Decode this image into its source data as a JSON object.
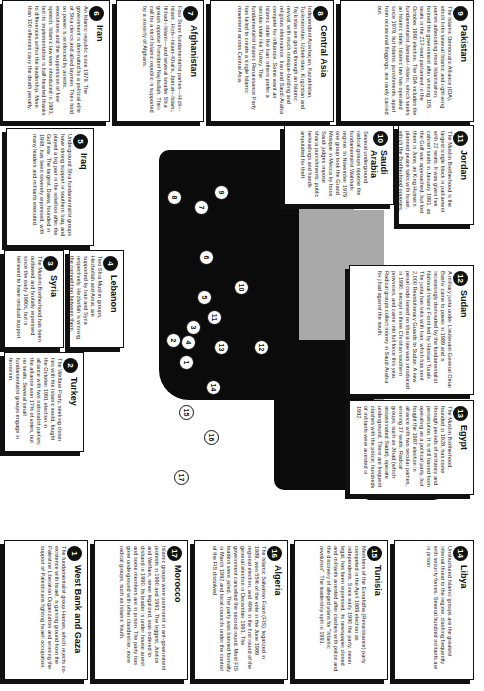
{
  "panels": [
    {
      "n": "1",
      "title": "West Bank and Gaza",
      "body": "The fundamentalist group Hamas, which rejects co-existence with Israel, is gaining ground from the Palestine Liberation Organization and winning the support of Palestinians fighting Israeli occupation."
    },
    {
      "n": "2",
      "title": "Turkey",
      "body": "The Welfare Party, seeking closer ties with the Islamic world, fought the October 1991 election in alliance with two nationalist parties; the alliance won 17% of votes, but no seats. Several small fundamentalist groups engage in terrorism."
    },
    {
      "n": "3",
      "title": "Syria",
      "body": "The Muslim Brotherhood has been outlawed and brutally repressed since the early 1980s, but is believed to have residual support."
    },
    {
      "n": "4",
      "title": "Lebanon",
      "body": "Two Shia Muslim groups, Hezbollah and Amal, are supported by Iran and Syria respectively. Hezbollah is winning the competition between them."
    },
    {
      "n": "5",
      "title": "Iraq",
      "body": "Underground Shia fundamentalist groups have strong support in southern Iraq, and played a big part in the rebellion after the Gulf war. The largest, Dawa, founded in 1968, has been severely repressed, with many leaders and militants executed."
    },
    {
      "n": "6",
      "title": "Iran",
      "body": "An Islamic republic since 1979. The government is dominated by a political elite of Shia clerics and allied laymen. Their hold on power is reinforced by arrests, executions and the suppression of free speech. Islamic law was introduced in 1983, but its implementation is half-hearted thanks to differences within the leadership. More than 100 offences carry the death penalty."
    },
    {
      "n": "7",
      "title": "Afghanistan",
      "body": "Four Sunni fundamentalist parties—Hizb-i-Islami, Hizb-i-Islami-Khalis, Jamiat-i-Islami, Ittihad-i-Islami—and several smaller Shia groups oppose President Najibullah. Their call for a strict Islamic republic is supported by a minority of Afghans."
    },
    {
      "n": "8",
      "title": "Central Asia",
      "body": "Independent Azerbaijan, Kazakhstan, Turkmenistan, Uzbekistan, Kirgizstan and Tajikistan are going through an Islamic revival, with much mosque-building and religious observance. Iran and Saudi Arabia compete for influence. Some want an Islamic state like Iran; others prefer a secular state like Turkey. The fundamentalist Islamic Renaissance Party has failed to create a single Islamic movement across Central Asia."
    },
    {
      "n": "9",
      "title": "Pakistan",
      "body": "The Islamic Democratic Alliance (IDA), which links several Islamic and right-wing parties advocating more Islamisation, formed the government after winning 105 seats in the 217-seat parliament in the October 1990 election. The IDA includes the fundamentalist Jamaat-i-Islami, which seeks an Islamic state. Islamic law has operated since 1979, but Islamic punishments, apart from occasional floggings, are rarely carried out."
    },
    {
      "n": "10",
      "title": "Saudi Arabia",
      "body": "Several underground radical groups oppose the fundamentalist Wahhabi regime. In November 1979 one group took the Grand Mosque in Mecca by force. Saudi judges impose sharia punishments: public beheadings and hands amputated for theft."
    },
    {
      "n": "11",
      "title": "Jordan",
      "body": "The Muslim Brotherhood is the largest single block in parliament with 22 seats. It was given five cabinet seats in January 1991, as the Gulf war approached, but lost them in June, as King Hussein planned peace talks with Israel, which the Brotherhood opposes."
    },
    {
      "n": "12",
      "title": "Sudan",
      "body": "A military junta under Lieutenant-General Omar Bashir came to power in 1989 and is increasingly dominated by the fundamentalist National Islamic Front led by Hassan Turabi. The junta has links with Iran, which has sent 2,000 Revolutionary Guards to Sudan. A new penal code based on sharia law was introduced in 1990, except in three Christian southern provinces, and came into full force this year. Radical groups collect money in Saudi Arabia for jihad against the south."
    },
    {
      "n": "13",
      "title": "Egypt",
      "body": "The Muslim Brotherhood, founded in 1928, has come through periods of militancy and persecution. It is still barred from operating as a political party, but fought the 1987 election in alliance with two secular parties, winning 37 seats. Radical groups, such as Jihad (which assassinated Sadat), operate underground. There are frequent clashes with the police; hundreds of militants were arrested in 1992."
    },
    {
      "n": "14",
      "title": "Libya",
      "body": "Unstructured Islamic groups are the greatest internal threat to the regime, clashing frequently with security forces. Several hundred militants are in prison."
    },
    {
      "n": "15",
      "title": "Tunisia",
      "body": "Members of the Ennahdha (Renaissance) party competed in the April 1989 election as independents. Since early 1990 the party, never legal, has been repressed, its newspaper closed and militants arrested after clashes with police and the discovery of alleged plans for \"Islamic revolution\". The leadership split in 1991."
    },
    {
      "n": "16",
      "title": "Algeria",
      "body": "The Islamic Salvation Front (FIS), legalized in 1989, won 55% of the vote in the June 1989 regional election, and 49% in the first round of the general election in December 1991. The government cancelled the second round. Most FIS leaders were jailed. The party was banned formally in March 1992 and local councils under the control of the FIS dissolved."
    },
    {
      "n": "17",
      "title": "Morocco",
      "body": "Islamic groups were prominent in anti-government protests in 1990 and 1991. The biggest, Justice and Welfare, never legalized, was ordered to disband in 1990. Its leader is under house arrest and some members are in prison. The party has gone underground with other clandestine, more radical groups, such as Islamic Youth."
    }
  ],
  "map": {
    "colors": {
      "land": "#0b0b0b",
      "sea": "#a9a9a9",
      "background": "#ffffff",
      "marker_fill": "#ffffff"
    },
    "markers": [
      "1",
      "2",
      "3",
      "4",
      "5",
      "6",
      "7",
      "8",
      "9",
      "10",
      "11",
      "12",
      "13",
      "14",
      "15",
      "16",
      "17"
    ]
  }
}
